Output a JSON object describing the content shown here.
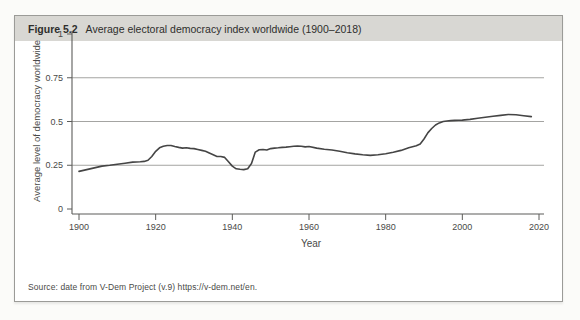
{
  "figure": {
    "label": "Figure 5.2",
    "title": "Average electoral democracy index worldwide (1900–2018)"
  },
  "source": "Source: date from V-Dem Project (v.9) https://v-dem.net/en.",
  "colors": {
    "page_bg": "#fbfbf9",
    "box_bg": "#ffffff",
    "box_border": "#9b9b98",
    "header_bg": "#d8d7d3",
    "text": "#4a4a48",
    "axis": "#5c5c5a",
    "grid": "#8d8d8a",
    "line": "#454545"
  },
  "chart_data": {
    "type": "line",
    "title": "Average electoral democracy index worldwide (1900–2018)",
    "xlabel": "Year",
    "ylabel": "Average level of democracy worldwide",
    "xlim": [
      1898,
      2021
    ],
    "ylim": [
      0,
      1
    ],
    "xticks": [
      1900,
      1920,
      1940,
      1960,
      1980,
      2000,
      2020
    ],
    "xtick_labels": [
      "1900",
      "1920",
      "1940",
      "1960",
      "1980",
      "2000",
      "2020"
    ],
    "yticks": [
      0,
      0.25,
      0.5,
      0.75,
      1
    ],
    "ytick_labels": [
      "0",
      "0.25",
      "0.5",
      "0.75",
      "1"
    ],
    "gridlines_at": [
      0.25,
      0.5,
      0.75
    ],
    "grid": "horizontal",
    "legend": false,
    "series": [
      {
        "name": "Average electoral democracy index",
        "x": [
          1900,
          1902,
          1904,
          1906,
          1908,
          1910,
          1912,
          1914,
          1916,
          1917,
          1918,
          1919,
          1920,
          1921,
          1922,
          1923,
          1924,
          1925,
          1926,
          1927,
          1928,
          1929,
          1930,
          1931,
          1932,
          1933,
          1934,
          1935,
          1936,
          1937,
          1938,
          1939,
          1940,
          1941,
          1942,
          1943,
          1944,
          1945,
          1946,
          1947,
          1948,
          1949,
          1950,
          1951,
          1952,
          1953,
          1954,
          1955,
          1956,
          1957,
          1958,
          1959,
          1960,
          1962,
          1964,
          1966,
          1968,
          1970,
          1972,
          1974,
          1976,
          1978,
          1980,
          1982,
          1984,
          1986,
          1988,
          1989,
          1990,
          1991,
          1992,
          1993,
          1994,
          1995,
          1996,
          1997,
          1998,
          1999,
          2000,
          2002,
          2004,
          2006,
          2008,
          2010,
          2012,
          2014,
          2016,
          2018
        ],
        "y": [
          0.215,
          0.225,
          0.235,
          0.245,
          0.25,
          0.256,
          0.262,
          0.268,
          0.27,
          0.272,
          0.278,
          0.3,
          0.33,
          0.35,
          0.358,
          0.363,
          0.363,
          0.357,
          0.352,
          0.348,
          0.35,
          0.346,
          0.345,
          0.34,
          0.335,
          0.33,
          0.32,
          0.31,
          0.3,
          0.3,
          0.295,
          0.27,
          0.245,
          0.23,
          0.227,
          0.225,
          0.23,
          0.26,
          0.325,
          0.338,
          0.34,
          0.337,
          0.345,
          0.348,
          0.35,
          0.352,
          0.354,
          0.356,
          0.358,
          0.36,
          0.358,
          0.355,
          0.357,
          0.348,
          0.342,
          0.337,
          0.33,
          0.322,
          0.315,
          0.31,
          0.306,
          0.31,
          0.316,
          0.324,
          0.335,
          0.35,
          0.362,
          0.372,
          0.4,
          0.435,
          0.46,
          0.48,
          0.492,
          0.5,
          0.503,
          0.505,
          0.506,
          0.507,
          0.508,
          0.512,
          0.518,
          0.524,
          0.53,
          0.535,
          0.54,
          0.538,
          0.533,
          0.528
        ]
      }
    ]
  }
}
